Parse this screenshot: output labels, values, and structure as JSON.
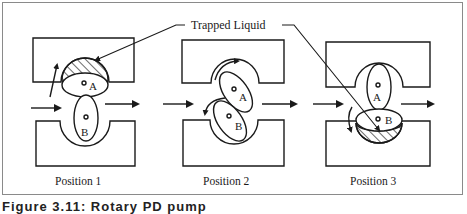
{
  "callout": {
    "label": "Trapped Liquid"
  },
  "positions": [
    {
      "label": "Position 1",
      "rotor_a": "A",
      "rotor_b": "B"
    },
    {
      "label": "Position 2",
      "rotor_a": "A",
      "rotor_b": "B"
    },
    {
      "label": "Position 3",
      "rotor_a": "A",
      "rotor_b": "B"
    }
  ],
  "caption": "Figure 3.11: Rotary PD pump",
  "colors": {
    "line": "#1a1a1a",
    "frame": "#8a8a8a",
    "background": "#ffffff"
  }
}
